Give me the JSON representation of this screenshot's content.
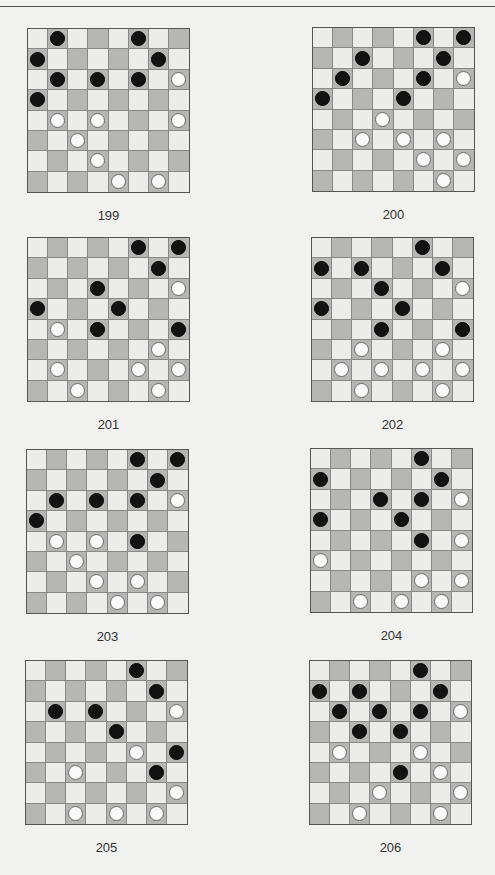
{
  "page": {
    "header_text": "",
    "colors": {
      "background": "#f1f1ef",
      "light_square": "#ececea",
      "dark_square": "#b6b6b4",
      "black_piece": "#121212",
      "white_piece": "#fafafa"
    }
  },
  "puzzles": [
    {
      "number": "199",
      "black": [
        [
          0,
          1
        ],
        [
          0,
          5
        ],
        [
          1,
          0
        ],
        [
          1,
          6
        ],
        [
          2,
          1
        ],
        [
          2,
          3
        ],
        [
          2,
          5
        ],
        [
          3,
          0
        ]
      ],
      "white": [
        [
          2,
          7
        ],
        [
          4,
          1
        ],
        [
          4,
          3
        ],
        [
          4,
          7
        ],
        [
          5,
          2
        ],
        [
          6,
          3
        ],
        [
          7,
          4
        ],
        [
          7,
          6
        ]
      ]
    },
    {
      "number": "200",
      "black": [
        [
          0,
          5
        ],
        [
          0,
          7
        ],
        [
          1,
          2
        ],
        [
          1,
          6
        ],
        [
          2,
          1
        ],
        [
          2,
          5
        ],
        [
          3,
          0
        ],
        [
          3,
          4
        ]
      ],
      "white": [
        [
          2,
          7
        ],
        [
          4,
          3
        ],
        [
          5,
          2
        ],
        [
          5,
          4
        ],
        [
          5,
          6
        ],
        [
          6,
          5
        ],
        [
          6,
          7
        ],
        [
          7,
          6
        ]
      ]
    },
    {
      "number": "201",
      "black": [
        [
          0,
          5
        ],
        [
          0,
          7
        ],
        [
          1,
          6
        ],
        [
          2,
          3
        ],
        [
          3,
          0
        ],
        [
          3,
          4
        ],
        [
          4,
          3
        ],
        [
          4,
          7
        ]
      ],
      "white": [
        [
          2,
          7
        ],
        [
          4,
          1
        ],
        [
          5,
          6
        ],
        [
          6,
          1
        ],
        [
          6,
          5
        ],
        [
          6,
          7
        ],
        [
          7,
          2
        ],
        [
          7,
          6
        ]
      ]
    },
    {
      "number": "202",
      "black": [
        [
          0,
          5
        ],
        [
          1,
          0
        ],
        [
          1,
          2
        ],
        [
          1,
          6
        ],
        [
          2,
          3
        ],
        [
          3,
          0
        ],
        [
          3,
          4
        ],
        [
          4,
          3
        ],
        [
          4,
          7
        ]
      ],
      "white": [
        [
          2,
          7
        ],
        [
          5,
          2
        ],
        [
          5,
          6
        ],
        [
          6,
          1
        ],
        [
          6,
          3
        ],
        [
          6,
          5
        ],
        [
          6,
          7
        ],
        [
          7,
          2
        ],
        [
          7,
          6
        ]
      ]
    },
    {
      "number": "203",
      "black": [
        [
          0,
          5
        ],
        [
          0,
          7
        ],
        [
          1,
          6
        ],
        [
          2,
          1
        ],
        [
          2,
          3
        ],
        [
          2,
          5
        ],
        [
          3,
          0
        ],
        [
          4,
          5
        ]
      ],
      "white": [
        [
          2,
          7
        ],
        [
          4,
          1
        ],
        [
          4,
          3
        ],
        [
          5,
          2
        ],
        [
          6,
          3
        ],
        [
          6,
          5
        ],
        [
          7,
          4
        ],
        [
          7,
          6
        ]
      ]
    },
    {
      "number": "204",
      "black": [
        [
          0,
          5
        ],
        [
          1,
          0
        ],
        [
          1,
          6
        ],
        [
          2,
          3
        ],
        [
          2,
          5
        ],
        [
          3,
          0
        ],
        [
          3,
          4
        ],
        [
          4,
          5
        ]
      ],
      "white": [
        [
          2,
          7
        ],
        [
          4,
          7
        ],
        [
          5,
          0
        ],
        [
          6,
          5
        ],
        [
          6,
          7
        ],
        [
          7,
          2
        ],
        [
          7,
          4
        ],
        [
          7,
          6
        ]
      ]
    },
    {
      "number": "205",
      "black": [
        [
          0,
          5
        ],
        [
          1,
          6
        ],
        [
          2,
          1
        ],
        [
          2,
          3
        ],
        [
          3,
          4
        ],
        [
          4,
          7
        ],
        [
          5,
          6
        ]
      ],
      "white": [
        [
          2,
          7
        ],
        [
          4,
          5
        ],
        [
          5,
          2
        ],
        [
          6,
          7
        ],
        [
          7,
          2
        ],
        [
          7,
          4
        ],
        [
          7,
          6
        ]
      ]
    },
    {
      "number": "206",
      "black": [
        [
          0,
          5
        ],
        [
          1,
          0
        ],
        [
          1,
          2
        ],
        [
          1,
          6
        ],
        [
          2,
          1
        ],
        [
          2,
          3
        ],
        [
          2,
          5
        ],
        [
          3,
          2
        ],
        [
          3,
          4
        ],
        [
          5,
          4
        ]
      ],
      "white": [
        [
          2,
          7
        ],
        [
          4,
          1
        ],
        [
          4,
          5
        ],
        [
          5,
          6
        ],
        [
          6,
          3
        ],
        [
          6,
          7
        ],
        [
          7,
          2
        ],
        [
          7,
          6
        ]
      ]
    }
  ]
}
